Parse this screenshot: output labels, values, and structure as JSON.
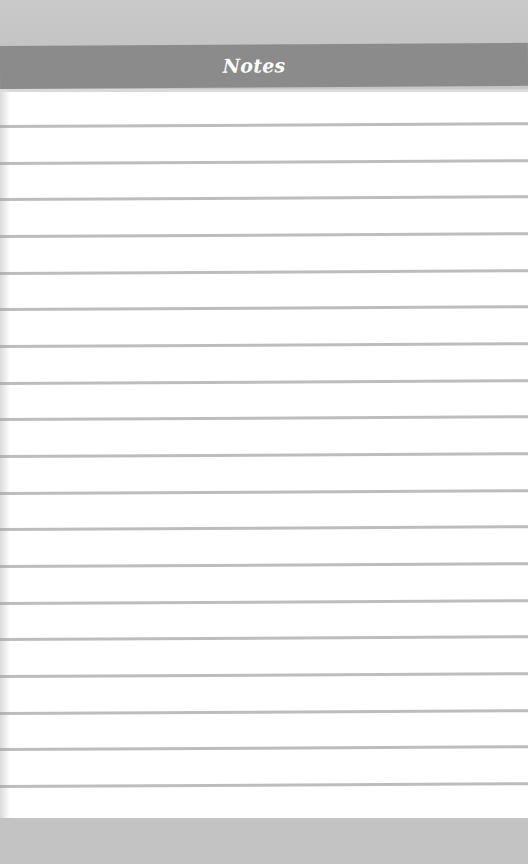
{
  "header": {
    "title": "Notes"
  },
  "paper": {
    "line_count": 19,
    "first_line_y": 125,
    "line_spacing": 36.67,
    "lines": [
      "",
      "",
      "",
      "",
      "",
      "",
      "",
      "",
      "",
      "",
      "",
      "",
      "",
      "",
      "",
      "",
      "",
      "",
      ""
    ]
  },
  "colors": {
    "background": "#c6c6c6",
    "header": "#8b8b8b",
    "header_text": "#ffffff",
    "paper": "#ffffff",
    "rule_line": "#bdbdbd"
  }
}
